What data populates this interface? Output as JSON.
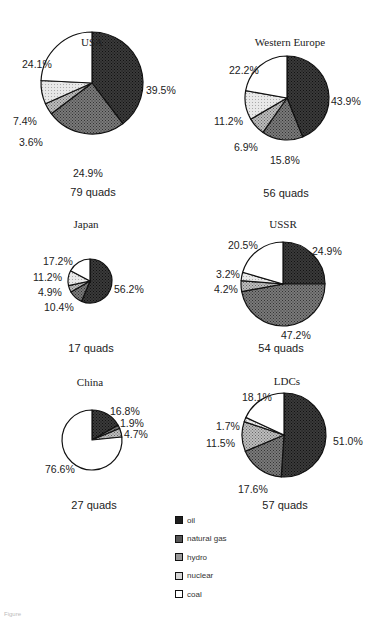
{
  "legend": {
    "items": [
      {
        "key": "oil",
        "label": "oil",
        "fill": "#2b2b2b"
      },
      {
        "key": "natural_gas",
        "label": "natural gas",
        "fill": "#5a5a5a"
      },
      {
        "key": "hydro",
        "label": "hydro",
        "fill": "#8c8c8c"
      },
      {
        "key": "nuclear",
        "label": "nuclear",
        "fill": "#cfcfcf"
      },
      {
        "key": "coal",
        "label": "coal",
        "fill": "#ffffff"
      }
    ]
  },
  "panels": [
    {
      "title": "USA",
      "quads": "79 quads"
    },
    {
      "title": "Western Europe",
      "quads": "56 quads"
    },
    {
      "title": "Japan",
      "quads": "17 quads"
    },
    {
      "title": "USSR",
      "quads": "54 quads"
    },
    {
      "title": "China",
      "quads": "27 quads"
    },
    {
      "title": "LDCs",
      "quads": "57 quads"
    }
  ],
  "labels": {
    "usa": {
      "oil": "39.5%",
      "natural_gas": "24.9%",
      "hydro": "3.6%",
      "nuclear": "7.4%",
      "coal": "24.1%"
    },
    "weu": {
      "oil": "43.9%",
      "natural_gas": "15.8%",
      "hydro": "6.9%",
      "nuclear": "11.2%",
      "coal": "22.2%"
    },
    "japan": {
      "oil": "56.2%",
      "natural_gas": "10.4%",
      "hydro": "4.9%",
      "nuclear": "11.2%",
      "coal": "17.2%"
    },
    "ussr": {
      "oil": "24.9%",
      "natural_gas": "47.2%",
      "hydro": "4.2%",
      "nuclear": "3.2%",
      "coal": "20.5%"
    },
    "china": {
      "oil": "16.8%",
      "natural_gas": "1.9%",
      "hydro": "4.7%",
      "coal": "76.6%"
    },
    "ldcs": {
      "oil": "51.0%",
      "natural_gas": "17.6%",
      "hydro": "11.5%",
      "nuclear": "1.7%",
      "coal": "18.1%"
    }
  },
  "caption": "Figure",
  "chart_data": [
    {
      "type": "pie",
      "title": "USA",
      "subtitle": "79 quads",
      "categories": [
        "oil",
        "natural gas",
        "hydro",
        "nuclear",
        "coal"
      ],
      "values": [
        39.5,
        24.9,
        3.6,
        7.4,
        24.1
      ]
    },
    {
      "type": "pie",
      "title": "Western Europe",
      "subtitle": "56 quads",
      "categories": [
        "oil",
        "natural gas",
        "hydro",
        "nuclear",
        "coal"
      ],
      "values": [
        43.9,
        15.8,
        6.9,
        11.2,
        22.2
      ]
    },
    {
      "type": "pie",
      "title": "Japan",
      "subtitle": "17 quads",
      "categories": [
        "oil",
        "natural gas",
        "hydro",
        "nuclear",
        "coal"
      ],
      "values": [
        56.2,
        10.4,
        4.9,
        11.2,
        17.2
      ]
    },
    {
      "type": "pie",
      "title": "USSR",
      "subtitle": "54 quads",
      "categories": [
        "oil",
        "natural gas",
        "hydro",
        "nuclear",
        "coal"
      ],
      "values": [
        24.9,
        47.2,
        4.2,
        3.2,
        20.5
      ]
    },
    {
      "type": "pie",
      "title": "China",
      "subtitle": "27 quads",
      "categories": [
        "oil",
        "natural gas",
        "hydro",
        "coal"
      ],
      "values": [
        16.8,
        1.9,
        4.7,
        76.6
      ]
    },
    {
      "type": "pie",
      "title": "LDCs",
      "subtitle": "57 quads",
      "categories": [
        "oil",
        "natural gas",
        "hydro",
        "nuclear",
        "coal"
      ],
      "values": [
        51.0,
        17.6,
        11.5,
        1.7,
        18.1
      ]
    }
  ]
}
